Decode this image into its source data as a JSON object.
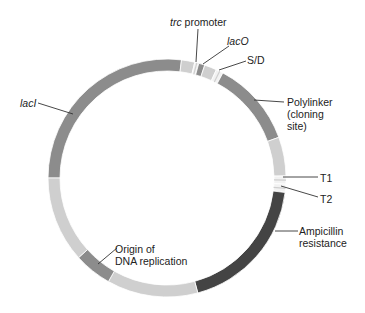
{
  "diagram": {
    "type": "plasmid-map",
    "center": [
      167,
      178
    ],
    "outer_radius": 119,
    "inner_radius": 107,
    "colors": {
      "light": "#cfcfcf",
      "medium": "#8c8c8c",
      "dark": "#444444",
      "white_stripe": "#f2f2f2",
      "label": "#222222",
      "leader": "#333333"
    },
    "segments": [
      {
        "name": "lacI",
        "start": 270,
        "end": 367,
        "shade": "medium"
      },
      {
        "name": "spacer-1",
        "start": 7,
        "end": 13.5,
        "shade": "light"
      },
      {
        "name": "trc-promoter",
        "start": 13.5,
        "end": 15.5,
        "shade": "white_stripe"
      },
      {
        "name": "lacO",
        "start": 15.5,
        "end": 18.5,
        "shade": "medium"
      },
      {
        "name": "spacer-2",
        "start": 18.5,
        "end": 24.5,
        "shade": "light"
      },
      {
        "name": "S/D",
        "start": 24.5,
        "end": 28,
        "shade": "white_stripe"
      },
      {
        "name": "polylinker",
        "start": 28,
        "end": 70,
        "shade": "medium"
      },
      {
        "name": "spacer-3",
        "start": 70,
        "end": 89,
        "shade": "light"
      },
      {
        "name": "T1",
        "start": 89,
        "end": 93,
        "shade": "white_stripe"
      },
      {
        "name": "T2",
        "start": 93,
        "end": 97,
        "shade": "white_stripe"
      },
      {
        "name": "ampicillin-resistance",
        "start": 97,
        "end": 165,
        "shade": "dark"
      },
      {
        "name": "spacer-4",
        "start": 165,
        "end": 209.5,
        "shade": "light"
      },
      {
        "name": "origin-of-replication",
        "start": 209.5,
        "end": 228,
        "shade": "medium"
      },
      {
        "name": "spacer-5",
        "start": 228,
        "end": 270,
        "shade": "light"
      }
    ],
    "labels": {
      "trc_italic": "trc",
      "trc_rest": " promoter",
      "laco": "lacO",
      "sd": "S/D",
      "polylinker_1": "Polylinker",
      "polylinker_2": "(cloning",
      "polylinker_3": "site)",
      "t1": "T1",
      "t2": "T2",
      "amp_1": "Ampicillin",
      "amp_2": "resistance",
      "ori_1": "Origin of",
      "ori_2": "DNA replication",
      "laci": "lacI"
    },
    "leaders": [
      {
        "name": "trc-leader",
        "x1": 198,
        "y1": 29,
        "x2": 196,
        "y2": 62
      },
      {
        "name": "laco-leader",
        "x1": 229,
        "y1": 46,
        "x2": 203,
        "y2": 64
      },
      {
        "name": "sd-leader",
        "x1": 246,
        "y1": 61,
        "x2": 219,
        "y2": 70
      },
      {
        "name": "polylinker-leader",
        "x1": 284,
        "y1": 102,
        "x2": 254,
        "y2": 100
      },
      {
        "name": "t1-leader",
        "x1": 318,
        "y1": 177,
        "x2": 283,
        "y2": 177
      },
      {
        "name": "t2-leader",
        "x1": 318,
        "y1": 197,
        "x2": 281,
        "y2": 186
      },
      {
        "name": "amp-leader",
        "x1": 298,
        "y1": 231,
        "x2": 275,
        "y2": 231
      },
      {
        "name": "ori-leader",
        "x1": 117,
        "y1": 248,
        "x2": 98,
        "y2": 264
      },
      {
        "name": "laci-leader",
        "x1": 38,
        "y1": 103,
        "x2": 73,
        "y2": 114
      }
    ]
  }
}
